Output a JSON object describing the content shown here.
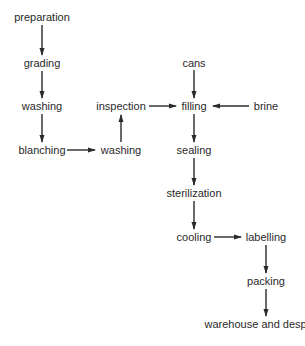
{
  "diagram": {
    "type": "flowchart",
    "title": "",
    "nodes": [
      {
        "id": "preparation",
        "label": "preparation",
        "x": 42,
        "y": 17
      },
      {
        "id": "grading",
        "label": "grading",
        "x": 42,
        "y": 63
      },
      {
        "id": "washing1",
        "label": "washing",
        "x": 42,
        "y": 106
      },
      {
        "id": "blanching",
        "label": "blanching",
        "x": 42,
        "y": 150
      },
      {
        "id": "washing2",
        "label": "washing",
        "x": 121,
        "y": 150
      },
      {
        "id": "inspection",
        "label": "inspection",
        "x": 121,
        "y": 106
      },
      {
        "id": "cans",
        "label": "cans",
        "x": 194,
        "y": 63
      },
      {
        "id": "filling",
        "label": "filling",
        "x": 194,
        "y": 106
      },
      {
        "id": "brine",
        "label": "brine",
        "x": 266,
        "y": 106
      },
      {
        "id": "sealing",
        "label": "sealing",
        "x": 194,
        "y": 150
      },
      {
        "id": "sterilization",
        "label": "sterilization",
        "x": 194,
        "y": 193
      },
      {
        "id": "cooling",
        "label": "cooling",
        "x": 194,
        "y": 237
      },
      {
        "id": "labelling",
        "label": "labelling",
        "x": 266,
        "y": 237
      },
      {
        "id": "packing",
        "label": "packing",
        "x": 266,
        "y": 281
      },
      {
        "id": "warehouse",
        "label": "warehouse and despatch",
        "x": 266,
        "y": 324
      }
    ],
    "edges": [
      {
        "from": "preparation",
        "to": "grading"
      },
      {
        "from": "grading",
        "to": "washing1"
      },
      {
        "from": "washing1",
        "to": "blanching"
      },
      {
        "from": "blanching",
        "to": "washing2"
      },
      {
        "from": "washing2",
        "to": "inspection"
      },
      {
        "from": "inspection",
        "to": "filling"
      },
      {
        "from": "cans",
        "to": "filling"
      },
      {
        "from": "brine",
        "to": "filling"
      },
      {
        "from": "filling",
        "to": "sealing"
      },
      {
        "from": "sealing",
        "to": "sterilization"
      },
      {
        "from": "sterilization",
        "to": "cooling"
      },
      {
        "from": "cooling",
        "to": "labelling"
      },
      {
        "from": "labelling",
        "to": "packing"
      },
      {
        "from": "packing",
        "to": "warehouse"
      }
    ],
    "colors": {
      "line": "#2a2a2a",
      "text": "#2a2a2a",
      "background": "#ffffff"
    }
  }
}
